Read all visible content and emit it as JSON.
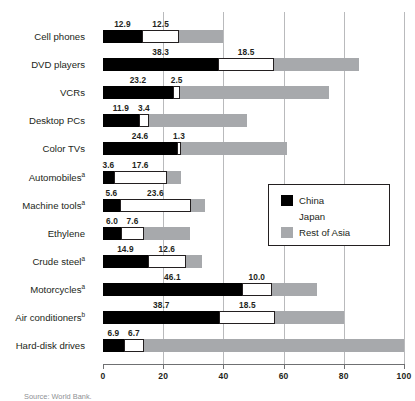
{
  "chart_data": {
    "type": "bar",
    "orientation": "horizontal",
    "stacked": true,
    "title": "",
    "xlabel": "",
    "ylabel": "",
    "xlim": [
      0,
      100
    ],
    "xticks": [
      0,
      20,
      40,
      60,
      80,
      100
    ],
    "xticklabels": [
      "0",
      "20",
      "40",
      "60",
      "80",
      "100"
    ],
    "grid": "vertical",
    "legend_position": "middle-right",
    "categories": [
      "Cell phones",
      "DVD players",
      "VCRs",
      "Desktop PCs",
      "Color TVs",
      "Automobiles",
      "Machine tools",
      "Ethylene",
      "Crude steel",
      "Motorcycles",
      "Air conditioners",
      "Hard-disk drives"
    ],
    "category_footnotes": [
      "",
      "",
      "",
      "",
      "",
      "a",
      "a",
      "",
      "a",
      "a",
      "b",
      ""
    ],
    "series": [
      {
        "name": "China",
        "color": "#000000",
        "values": [
          12.9,
          38.3,
          23.2,
          11.9,
          24.6,
          3.6,
          5.6,
          6.0,
          14.9,
          46.1,
          38.7,
          6.9
        ],
        "labels": [
          "12.9",
          "38.3",
          "23.2",
          "11.9",
          "24.6",
          "3.6",
          "5.6",
          "6.0",
          "14.9",
          "46.1",
          "38.7",
          "6.9"
        ]
      },
      {
        "name": "Japan",
        "color": "#ffffff",
        "values": [
          12.5,
          18.5,
          2.5,
          3.4,
          1.3,
          17.6,
          23.6,
          7.6,
          12.6,
          10.0,
          18.5,
          6.7
        ],
        "labels": [
          "12.5",
          "18.5",
          "2.5",
          "3.4",
          "1.3",
          "17.6",
          "23.6",
          "7.6",
          "12.6",
          "10.0",
          "18.5",
          "6.7"
        ]
      },
      {
        "name": "Rest of Asia",
        "color": "#a7a9ac",
        "values": [
          14.6,
          28.2,
          49.3,
          32.7,
          35.1,
          4.8,
          4.8,
          15.4,
          5.5,
          14.9,
          22.8,
          86.4
        ],
        "labels": [
          "",
          "",
          "",
          "",
          "",
          "",
          "",
          "",
          "",
          "",
          "",
          ""
        ]
      }
    ],
    "totals": [
      40.0,
      85.0,
      75.0,
      48.0,
      61.0,
      26.0,
      34.0,
      29.0,
      33.0,
      71.0,
      80.0,
      100.0
    ]
  },
  "legend": {
    "items": [
      {
        "label": "China",
        "swatch": "china-swatch"
      },
      {
        "label": "Japan",
        "swatch": "japan-swatch"
      },
      {
        "label": "Rest of Asia",
        "swatch": "rest-of-asia-swatch"
      }
    ]
  },
  "colors": {
    "china": "#000000",
    "japan": "#ffffff",
    "rest_of_asia": "#a7a9ac",
    "gridline": "#b9babc",
    "text": "#231f20"
  },
  "source": {
    "text": "Source: World Bank."
  }
}
